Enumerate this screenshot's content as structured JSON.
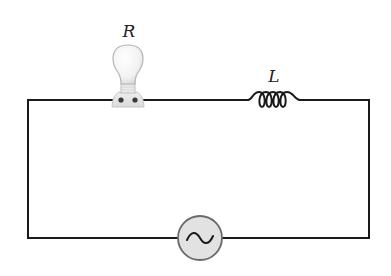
{
  "diagram": {
    "type": "RL circuit",
    "components": {
      "resistor": {
        "label": "R",
        "depicted_as": "light bulb"
      },
      "inductor": {
        "label": "L",
        "turns": 4
      },
      "source": {
        "symbol": "~",
        "type": "AC source"
      }
    },
    "colors": {
      "wire": "#1a1a1a",
      "bulb_glass": "#f4f4f4",
      "bulb_outline": "#b5b5b5",
      "source_fill": "#e2e2e2",
      "source_outline": "#6a6a6a"
    }
  }
}
